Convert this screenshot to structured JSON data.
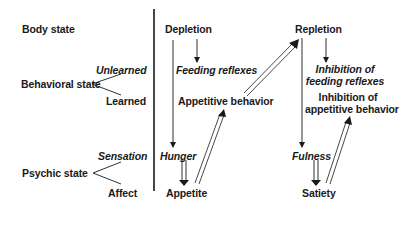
{
  "left_labels": {
    "body_state": "Body state",
    "behavioral_state": "Behavioral state",
    "behavioral_unlearned": "Unlearned",
    "behavioral_learned": "Learned",
    "psychic_state": "Psychic state",
    "psychic_sensation": "Sensation",
    "psychic_affect": "Affect"
  },
  "depletion_column": {
    "body": "Depletion",
    "unlearned": "Feeding reflexes",
    "learned": "Appetitive behavior",
    "sensation": "Hunger",
    "affect": "Appetite"
  },
  "repletion_column": {
    "body": "Repletion",
    "unlearned_line1": "Inhibition of",
    "unlearned_line2": "feeding reflexes",
    "learned_line1": "Inhibition of",
    "learned_line2": "appetitive behavior",
    "sensation": "Fulness",
    "affect": "Satiety"
  },
  "colors": {
    "ink": "#1a1a1a",
    "background": "#ffffff"
  }
}
